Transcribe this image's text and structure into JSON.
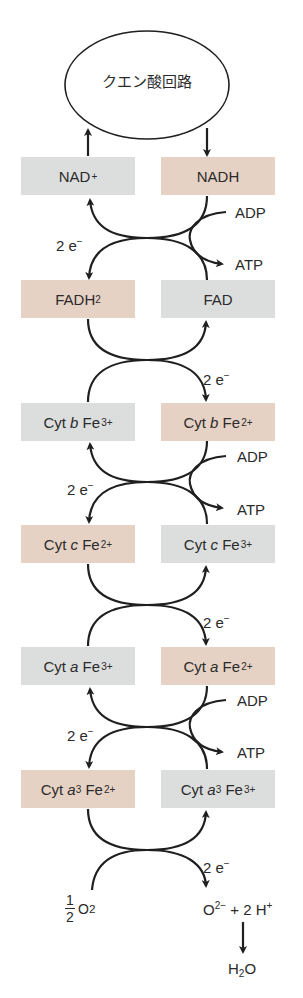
{
  "title": "クエン酸回路",
  "colors": {
    "oxidized_box": "#dcdedd",
    "reduced_box": "#e6d2c4",
    "stroke": "#1f1f1f"
  },
  "rows": [
    {
      "left": {
        "main": "NAD",
        "sup": "+",
        "sub": "",
        "state": "oxidized"
      },
      "right": {
        "main": "NADH",
        "sup": "",
        "sub": "",
        "state": "reduced"
      }
    },
    {
      "left": {
        "main": "FADH",
        "sup": "",
        "sub": "2",
        "state": "reduced"
      },
      "right": {
        "main": "FAD",
        "sup": "",
        "sub": "",
        "state": "oxidized"
      }
    },
    {
      "left": {
        "prefix": "Cyt ",
        "italic": "b",
        "main": " Fe",
        "sup": "3+",
        "state": "oxidized"
      },
      "right": {
        "prefix": "Cyt ",
        "italic": "b",
        "main": " Fe",
        "sup": "2+",
        "state": "reduced"
      }
    },
    {
      "left": {
        "prefix": "Cyt ",
        "italic": "c",
        "main": " Fe",
        "sup": "2+",
        "state": "reduced"
      },
      "right": {
        "prefix": "Cyt ",
        "italic": "c",
        "main": " Fe",
        "sup": "3+",
        "state": "oxidized"
      }
    },
    {
      "left": {
        "prefix": "Cyt ",
        "italic": "a",
        "main": " Fe",
        "sup": "3+",
        "state": "oxidized"
      },
      "right": {
        "prefix": "Cyt ",
        "italic": "a",
        "main": " Fe",
        "sup": "2+",
        "state": "reduced"
      }
    },
    {
      "left": {
        "prefix": "Cyt ",
        "italic": "a",
        "italic_sub": "3",
        "main": " Fe",
        "sup": "2+",
        "state": "reduced"
      },
      "right": {
        "prefix": "Cyt ",
        "italic": "a",
        "italic_sub": "3",
        "main": " Fe",
        "sup": "3+",
        "state": "oxidized"
      }
    }
  ],
  "electron_label": {
    "text": "2 e",
    "sup": "−"
  },
  "phosphorylation": {
    "input": "ADP",
    "output": "ATP"
  },
  "oxygen": {
    "numerator": "1",
    "denominator": "2",
    "species": "O",
    "sub": "2"
  },
  "product": {
    "ion": "O",
    "ion_sup": "2−",
    "plus": "+ 2 H",
    "plus_sup": "+"
  },
  "final": {
    "main": "H",
    "sub": "2",
    "tail": "O"
  }
}
